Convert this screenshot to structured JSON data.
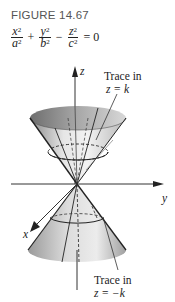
{
  "figure": {
    "caption": "FIGURE 14.67",
    "equation": {
      "term1": {
        "num": "x",
        "den": "a"
      },
      "op1": "+",
      "term2": {
        "num": "y",
        "den": "b"
      },
      "op2": "−",
      "term3": {
        "num": "z",
        "den": "c"
      },
      "rhs": "= 0",
      "exponent": "2"
    },
    "axes": {
      "x_label": "x",
      "y_label": "y",
      "z_label": "z"
    },
    "annotations": {
      "top_trace_line1": "Trace in",
      "top_trace_line2": "z = k",
      "bottom_trace_line1": "Trace in",
      "bottom_trace_line2": "z = −k"
    }
  }
}
